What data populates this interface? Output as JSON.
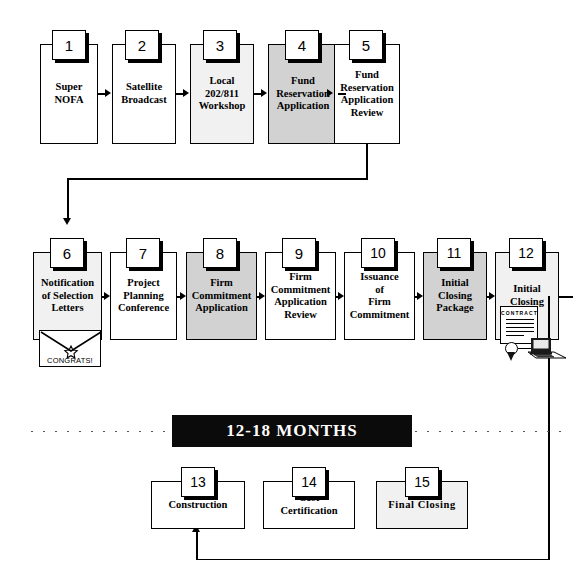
{
  "diagram": {
    "timeline_banner": "12-18 MONTHS",
    "colors": {
      "box_fill_white": "#ffffff",
      "box_fill_light": "#f1f1f1",
      "box_fill_mid": "#d2d2d2",
      "line": "#000000",
      "banner_bg": "#0b0b0b",
      "banner_text": "#ffffff"
    },
    "rows": [
      {
        "name": "row-1",
        "steps": [
          {
            "number": "1",
            "label": "Super\nNOFA",
            "fill": "white"
          },
          {
            "number": "2",
            "label": "Satellite\nBroadcast",
            "fill": "white"
          },
          {
            "number": "3",
            "label": "Local\n202/811\nWorkshop",
            "fill": "light"
          },
          {
            "number": "4",
            "label": "Fund\nReservation\nApplication",
            "fill": "mid"
          },
          {
            "number": "5",
            "label": "Fund\nReservation\nApplication\nReview",
            "fill": "white"
          }
        ]
      },
      {
        "name": "row-2",
        "steps": [
          {
            "number": "6",
            "label": "Notification\nof Selection\nLetters",
            "fill": "light"
          },
          {
            "number": "7",
            "label": "Project\nPlanning\nConference",
            "fill": "white"
          },
          {
            "number": "8",
            "label": "Firm\nCommitment\nApplication",
            "fill": "mid"
          },
          {
            "number": "9",
            "label": "Firm\nCommitment\nApplication\nReview",
            "fill": "white"
          },
          {
            "number": "10",
            "label": "Issuance\nof\nFirm\nCommitment",
            "fill": "white"
          },
          {
            "number": "11",
            "label": "Initial\nClosing\nPackage",
            "fill": "mid"
          },
          {
            "number": "12",
            "label": "Initial\nClosing",
            "fill": "light"
          }
        ]
      },
      {
        "name": "row-3",
        "steps": [
          {
            "number": "13",
            "label": "Construction",
            "fill": "white"
          },
          {
            "number": "14",
            "label": "Cost\nCertification",
            "fill": "white"
          },
          {
            "number": "15",
            "label": "Final  Closing",
            "fill": "light"
          }
        ]
      }
    ],
    "icons": {
      "envelope": {
        "name": "congrats-envelope-icon",
        "caption": "CONGRATS!"
      },
      "contract": {
        "name": "contract-seal-icon",
        "document_title": "CONTRACT"
      }
    }
  }
}
